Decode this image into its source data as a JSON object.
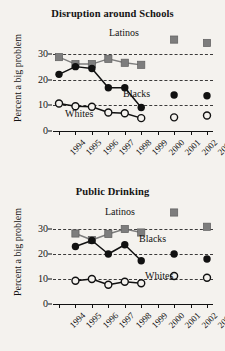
{
  "figure": {
    "background_color": "#f4f2ee",
    "ink_color": "#141414"
  },
  "charts": [
    {
      "id": "disruption-around-schools",
      "title": "Disruption around Schools",
      "ylabel": "Percent a big problem",
      "series_labels": {
        "latinos": "Latinos",
        "blacks": "Blacks",
        "whites": "Whites"
      }
    },
    {
      "id": "public-drinking",
      "title": "Public Drinking",
      "ylabel": "Percent a big problem",
      "series_labels": {
        "latinos": "Latinos",
        "blacks": "Blacks",
        "whites": "Whites"
      }
    }
  ],
  "chart_data": [
    {
      "type": "line",
      "id": "disruption-around-schools",
      "title": "Disruption around Schools",
      "xlabel": "",
      "ylabel": "Percent a big problem",
      "x": [
        "1994",
        "1995",
        "1996",
        "1997",
        "1998",
        "1999",
        "2000",
        "2001",
        "2002",
        "2003"
      ],
      "xtick_labels": [
        "1994",
        "1995",
        "1996",
        "1997",
        "1998",
        "1999",
        "2000",
        "2001",
        "2002",
        "2003"
      ],
      "ytick_labels": [
        "0",
        "10",
        "20",
        "30"
      ],
      "yticks": [
        0,
        10,
        20,
        30
      ],
      "ylim": [
        0,
        40
      ],
      "grid": "horizontal-dashed-at-10-20-30",
      "legend": "inline-labels",
      "series": [
        {
          "name": "Latinos",
          "marker": "filled-square",
          "color": "#7d7d7d",
          "values": [
            28.7,
            26.0,
            26.0,
            28.0,
            26.5,
            25.7,
            null,
            35.5,
            null,
            34.2
          ]
        },
        {
          "name": "Blacks",
          "marker": "filled-circle",
          "color": "#111111",
          "values": [
            22.0,
            25.0,
            24.3,
            16.8,
            16.8,
            9.1,
            null,
            14.0,
            null,
            13.7
          ]
        },
        {
          "name": "Whites",
          "marker": "open-circle",
          "color": "#111111",
          "values": [
            10.7,
            9.6,
            9.4,
            7.2,
            6.9,
            5.0,
            null,
            5.3,
            null,
            6.0
          ]
        }
      ]
    },
    {
      "type": "line",
      "id": "public-drinking",
      "title": "Public Drinking",
      "xlabel": "",
      "ylabel": "Percent a big problem",
      "x": [
        "1994",
        "1995",
        "1996",
        "1997",
        "1998",
        "1999",
        "2000",
        "2001",
        "2002",
        "2003"
      ],
      "xtick_labels": [
        "1994",
        "1995",
        "1996",
        "1997",
        "1998",
        "1999",
        "2000",
        "2001",
        "2002",
        "2003"
      ],
      "ytick_labels": [
        "0",
        "10",
        "20",
        "30"
      ],
      "yticks": [
        0,
        10,
        20,
        30
      ],
      "ylim": [
        0,
        40
      ],
      "grid": "horizontal-dashed-at-10-20-30",
      "legend": "inline-labels",
      "series": [
        {
          "name": "Latinos",
          "marker": "filled-square",
          "color": "#7d7d7d",
          "values": [
            null,
            28.2,
            25.6,
            28.0,
            30.0,
            28.6,
            null,
            36.6,
            null,
            30.9
          ]
        },
        {
          "name": "Blacks",
          "marker": "filled-circle",
          "color": "#111111",
          "values": [
            null,
            23.0,
            25.4,
            20.0,
            23.7,
            17.3,
            null,
            20.0,
            null,
            18.0
          ]
        },
        {
          "name": "Whites",
          "marker": "open-circle",
          "color": "#111111",
          "values": [
            null,
            9.3,
            10.0,
            7.7,
            8.9,
            8.3,
            null,
            11.2,
            null,
            10.5
          ]
        }
      ]
    }
  ]
}
